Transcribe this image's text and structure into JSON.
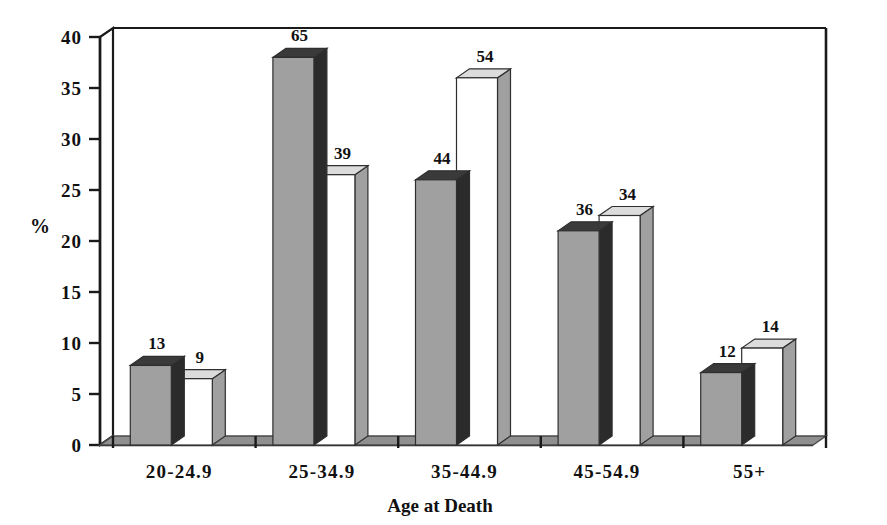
{
  "chart_data": {
    "type": "bar",
    "title": "",
    "xlabel": "Age at Death",
    "ylabel": "%",
    "ylim": [
      0,
      40
    ],
    "yticks": [
      0,
      5,
      10,
      15,
      20,
      25,
      30,
      35,
      40
    ],
    "ytick_labels": [
      "0",
      "5",
      "10",
      "15",
      "20",
      "25",
      "30",
      "35",
      "40"
    ],
    "grid": false,
    "legend": "none",
    "style": "3d-clustered-column",
    "categories": [
      "20-24.9",
      "25-34.9",
      "35-44.9",
      "45-54.9",
      "55+"
    ],
    "series": [
      {
        "name": "series-1",
        "fill": "#a0a0a0",
        "top_fill": "#3a3a3a",
        "side_fill": "#2b2b2b",
        "values": [
          7.8,
          38.0,
          26.0,
          21.0,
          7.1
        ],
        "point_labels": [
          "13",
          "65",
          "44",
          "36",
          "12"
        ]
      },
      {
        "name": "series-2",
        "fill": "#ffffff",
        "top_fill": "#dcdcdc",
        "side_fill": "#a0a0a0",
        "values": [
          6.5,
          26.5,
          36.0,
          22.5,
          9.5
        ],
        "point_labels": [
          "9",
          "39",
          "54",
          "34",
          "14"
        ]
      }
    ]
  },
  "axes": {
    "y_title": "%",
    "x_title": "Age at Death"
  },
  "colors": {
    "axis_line": "#1a1a1a",
    "bar_gray": "#a0a0a0",
    "bar_gray_top": "#3a3a3a",
    "bar_white": "#ffffff",
    "bar_white_top": "#dcdcdc",
    "bar_white_side": "#a0a0a0",
    "floor": "#8f8f8f",
    "floor_front": "#6e6e6e",
    "text": "#111111",
    "background": "#ffffff"
  }
}
